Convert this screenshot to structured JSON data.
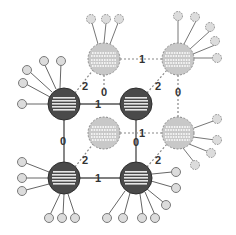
{
  "diagram": {
    "type": "lattice-network",
    "colors": {
      "dark_node_fill": "#4a4a4a",
      "dark_node_stroke": "#2e2e2e",
      "light_node_fill": "#c8c8c8",
      "light_node_stroke": "#8a8a8a",
      "leaf_fill": "#dcdcdc",
      "leaf_stroke": "#7a7a7a",
      "edge_solid": "#555555",
      "edge_dashed": "#888888",
      "stripe_dark_node": "#e6e6e6",
      "stripe_light_node": "#ffffff"
    },
    "nodes": [
      {
        "id": "dark-tl",
        "kind": "dark",
        "x": 64,
        "y": 104
      },
      {
        "id": "dark-c",
        "kind": "dark",
        "x": 136,
        "y": 104
      },
      {
        "id": "dark-bl",
        "kind": "dark",
        "x": 64,
        "y": 178
      },
      {
        "id": "dark-br",
        "kind": "dark",
        "x": 136,
        "y": 178
      },
      {
        "id": "light-t1",
        "kind": "light",
        "x": 104,
        "y": 59
      },
      {
        "id": "light-t2",
        "kind": "light",
        "x": 178,
        "y": 59
      },
      {
        "id": "light-m1",
        "kind": "light",
        "x": 104,
        "y": 133
      },
      {
        "id": "light-m2",
        "kind": "light",
        "x": 178,
        "y": 133
      }
    ],
    "edge_labels": [
      {
        "text": "2",
        "x": 84,
        "y": 86
      },
      {
        "text": "1",
        "x": 97,
        "y": 108
      },
      {
        "text": "0",
        "x": 101,
        "y": 94
      },
      {
        "text": "1",
        "x": 141,
        "y": 63
      },
      {
        "text": "2",
        "x": 156,
        "y": 86
      },
      {
        "text": "0",
        "x": 175,
        "y": 94
      },
      {
        "text": "0",
        "x": 61,
        "y": 146
      },
      {
        "text": "2",
        "x": 84,
        "y": 160
      },
      {
        "text": "1",
        "x": 141,
        "y": 137
      },
      {
        "text": "0",
        "x": 133,
        "y": 146
      },
      {
        "text": "2",
        "x": 156,
        "y": 160
      },
      {
        "text": "1",
        "x": 97,
        "y": 182
      }
    ]
  }
}
